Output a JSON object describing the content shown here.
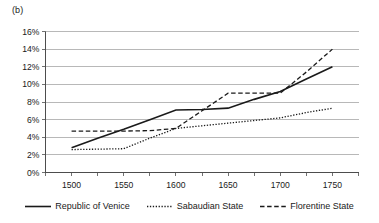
{
  "panel": {
    "label": "(b)"
  },
  "chart_data": {
    "type": "line",
    "title": "",
    "subtitle": "",
    "xlabel": "",
    "ylabel": "",
    "xlim": [
      1475,
      1775
    ],
    "ylim": [
      0,
      16
    ],
    "grid": true,
    "grid_axis": "y",
    "legend_position": "bottom",
    "x": [
      1500,
      1525,
      1550,
      1575,
      1600,
      1625,
      1650,
      1675,
      1700,
      1725,
      1750
    ],
    "x_tick_labels": [
      "1500",
      "1550",
      "1600",
      "1650",
      "1700",
      "1750"
    ],
    "x_tick_values": [
      1500,
      1550,
      1600,
      1650,
      1700,
      1750
    ],
    "x_minor_tick_values": [
      1475,
      1500,
      1525,
      1550,
      1575,
      1600,
      1625,
      1650,
      1675,
      1700,
      1725,
      1750,
      1775
    ],
    "y_tick_labels": [
      "0%",
      "2%",
      "4%",
      "6%",
      "8%",
      "10%",
      "12%",
      "14%",
      "16%"
    ],
    "y_tick_values": [
      0,
      2,
      4,
      6,
      8,
      10,
      12,
      14,
      16
    ],
    "y_unit": "%",
    "series": [
      {
        "name": "Republic of Venice",
        "style": "solid",
        "color": "#1a1a1a",
        "values": [
          2.8,
          3.9,
          4.9,
          6.0,
          7.1,
          7.15,
          7.3,
          8.3,
          9.2,
          10.6,
          12.0
        ]
      },
      {
        "name": "Sabaudian State",
        "style": "dotted",
        "color": "#1a1a1a",
        "values": [
          2.6,
          2.65,
          2.7,
          3.9,
          5.0,
          5.3,
          5.6,
          5.9,
          6.2,
          6.8,
          7.3
        ]
      },
      {
        "name": "Florentine State",
        "style": "dashed",
        "color": "#1a1a1a",
        "values": [
          4.7,
          4.7,
          4.7,
          4.75,
          5.0,
          7.0,
          9.0,
          9.0,
          9.0,
          11.4,
          14.0
        ]
      }
    ]
  },
  "legend": {
    "items": [
      {
        "label": "Republic of Venice",
        "style": "solid"
      },
      {
        "label": "Sabaudian State",
        "style": "dotted"
      },
      {
        "label": "Florentine State",
        "style": "dashed"
      }
    ]
  }
}
